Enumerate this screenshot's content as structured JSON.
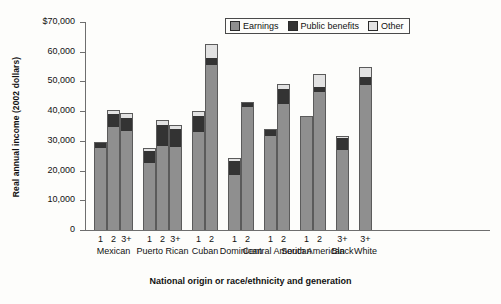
{
  "chart_data": {
    "type": "bar",
    "subtype": "stacked-bar-grouped",
    "title": "",
    "xlabel": "National origin or race/ethnicity and generation",
    "ylabel": "Real annual income (2002 dollars)",
    "ylim": [
      0,
      70000
    ],
    "yticks": [
      0,
      10000,
      20000,
      30000,
      40000,
      50000,
      60000,
      70000
    ],
    "ytick_labels": [
      "0",
      "10,000",
      "20,000",
      "30,000",
      "40,000",
      "50,000",
      "60,000",
      "$70,000"
    ],
    "grid": false,
    "legend_position": "top-right",
    "series": [
      {
        "name": "Earnings",
        "color": "#8f8f8f"
      },
      {
        "name": "Public benefits",
        "color": "#333333"
      },
      {
        "name": "Other",
        "color": "#e2e2e2"
      }
    ],
    "groups": [
      {
        "group": "Mexican",
        "bars": [
          {
            "generation": "1",
            "earnings": 27500,
            "public_benefits": 1900,
            "other": 300,
            "total": 29700
          },
          {
            "generation": "2",
            "earnings": 34800,
            "public_benefits": 4100,
            "other": 1500,
            "total": 40400
          },
          {
            "generation": "3+",
            "earnings": 33200,
            "public_benefits": 4600,
            "other": 1700,
            "total": 39500
          }
        ]
      },
      {
        "group": "Puerto Rican",
        "bars": [
          {
            "generation": "1",
            "earnings": 22400,
            "public_benefits": 4300,
            "other": 1000,
            "total": 27700
          },
          {
            "generation": "2",
            "earnings": 28400,
            "public_benefits": 7000,
            "other": 1600,
            "total": 37000
          },
          {
            "generation": "3+",
            "earnings": 28100,
            "public_benefits": 6000,
            "other": 1100,
            "total": 35200
          }
        ]
      },
      {
        "group": "Cuban",
        "bars": [
          {
            "generation": "1",
            "earnings": 33100,
            "public_benefits": 5300,
            "other": 1600,
            "total": 40000
          },
          {
            "generation": "2",
            "earnings": 55500,
            "public_benefits": 2500,
            "other": 4500,
            "total": 62500
          }
        ]
      },
      {
        "group": "Dominican",
        "bars": [
          {
            "generation": "1",
            "earnings": 18600,
            "public_benefits": 4500,
            "other": 1300,
            "total": 24400
          },
          {
            "generation": "2",
            "earnings": 41500,
            "public_benefits": 1200,
            "other": 200,
            "total": 42900
          }
        ]
      },
      {
        "group": "Central American",
        "bars": [
          {
            "generation": "1",
            "earnings": 31800,
            "public_benefits": 1700,
            "other": 300,
            "total": 33800
          },
          {
            "generation": "2",
            "earnings": 42500,
            "public_benefits": 4800,
            "other": 1700,
            "total": 49000
          }
        ]
      },
      {
        "group": "South American",
        "bars": [
          {
            "generation": "1",
            "earnings": 38300,
            "public_benefits": 0,
            "other": 0,
            "total": 38300
          },
          {
            "generation": "2",
            "earnings": 46500,
            "public_benefits": 1500,
            "other": 4500,
            "total": 52500
          }
        ]
      },
      {
        "group": "Black",
        "bars": [
          {
            "generation": "3+",
            "earnings": 27000,
            "public_benefits": 4000,
            "other": 800,
            "total": 31800
          }
        ]
      },
      {
        "group": "White",
        "bars": [
          {
            "generation": "3+",
            "earnings": 48800,
            "public_benefits": 2700,
            "other": 3500,
            "total": 55000
          }
        ]
      }
    ]
  }
}
